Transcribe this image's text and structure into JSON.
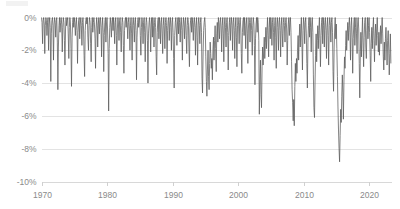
{
  "chart_data": {
    "type": "line",
    "title": "",
    "subtitle": "",
    "xlabel": "",
    "ylabel": "",
    "xlim": [
      1970,
      2023.5
    ],
    "ylim": [
      -10,
      0
    ],
    "grid": true,
    "legend": false,
    "legend_position": "none",
    "series_name": "Drawdown",
    "line_color": "#595959",
    "grid_color": "#e3e3e3",
    "tick_label_color": "#8a8a8a",
    "background_color": "#ffffff",
    "y_ticks": [
      0,
      -2,
      -4,
      -6,
      -8,
      -10
    ],
    "y_tick_labels": [
      "0%",
      "-2%",
      "-4%",
      "-6%",
      "-8%",
      "-10%"
    ],
    "x_ticks": [
      1970,
      1980,
      1990,
      2000,
      2010,
      2020
    ],
    "x_tick_labels": [
      "1970",
      "1980",
      "1990",
      "2000",
      "2010",
      "2020"
    ],
    "x": [
      1970.0,
      1970.08,
      1970.17,
      1970.25,
      1970.33,
      1970.42,
      1970.5,
      1970.58,
      1970.67,
      1970.75,
      1970.83,
      1970.92,
      1971.0,
      1971.08,
      1971.17,
      1971.25,
      1971.33,
      1971.42,
      1971.5,
      1971.58,
      1971.67,
      1971.75,
      1971.83,
      1971.92,
      1972.0,
      1972.08,
      1972.17,
      1972.25,
      1972.33,
      1972.42,
      1972.5,
      1972.58,
      1972.67,
      1972.75,
      1972.83,
      1972.92,
      1973.0,
      1973.08,
      1973.17,
      1973.25,
      1973.33,
      1973.42,
      1973.5,
      1973.58,
      1973.67,
      1973.75,
      1973.83,
      1973.92,
      1974.0,
      1974.08,
      1974.17,
      1974.25,
      1974.33,
      1974.42,
      1974.5,
      1974.58,
      1974.67,
      1974.75,
      1974.83,
      1974.92,
      1975.0,
      1975.08,
      1975.17,
      1975.25,
      1975.33,
      1975.42,
      1975.5,
      1975.58,
      1975.67,
      1975.75,
      1975.83,
      1975.92,
      1976.0,
      1976.08,
      1976.17,
      1976.25,
      1976.33,
      1976.42,
      1976.5,
      1976.58,
      1976.67,
      1976.75,
      1976.83,
      1976.92,
      1977.0,
      1977.08,
      1977.17,
      1977.25,
      1977.33,
      1977.42,
      1977.5,
      1977.58,
      1977.67,
      1977.75,
      1977.83,
      1977.92,
      1978.0,
      1978.08,
      1978.17,
      1978.25,
      1978.33,
      1978.42,
      1978.5,
      1978.58,
      1978.67,
      1978.75,
      1978.83,
      1978.92,
      1979.0,
      1979.08,
      1979.17,
      1979.25,
      1979.33,
      1979.42,
      1979.5,
      1979.58,
      1979.67,
      1979.75,
      1979.83,
      1979.92,
      1980.0,
      1980.08,
      1980.17,
      1980.25,
      1980.33,
      1980.42,
      1980.5,
      1980.58,
      1980.67,
      1980.75,
      1980.83,
      1980.92,
      1981.0,
      1981.08,
      1981.17,
      1981.25,
      1981.33,
      1981.42,
      1981.5,
      1981.58,
      1981.67,
      1981.75,
      1981.83,
      1981.92,
      1982.0,
      1982.08,
      1982.17,
      1982.25,
      1982.33,
      1982.42,
      1982.5,
      1982.58,
      1982.67,
      1982.75,
      1982.83,
      1982.92,
      1983.0,
      1983.08,
      1983.17,
      1983.25,
      1983.33,
      1983.42,
      1983.5,
      1983.58,
      1983.67,
      1983.75,
      1983.83,
      1983.92,
      1984.0,
      1984.08,
      1984.17,
      1984.25,
      1984.33,
      1984.42,
      1984.5,
      1984.58,
      1984.67,
      1984.75,
      1984.83,
      1984.92,
      1985.0,
      1985.08,
      1985.17,
      1985.25,
      1985.33,
      1985.42,
      1985.5,
      1985.58,
      1985.67,
      1985.75,
      1985.83,
      1985.92,
      1986.0,
      1986.08,
      1986.17,
      1986.25,
      1986.33,
      1986.42,
      1986.5,
      1986.58,
      1986.67,
      1986.75,
      1986.83,
      1986.92,
      1987.0,
      1987.08,
      1987.17,
      1987.25,
      1987.33,
      1987.42,
      1987.5,
      1987.58,
      1987.67,
      1987.75,
      1987.83,
      1987.92,
      1988.0,
      1988.08,
      1988.17,
      1988.25,
      1988.33,
      1988.42,
      1988.5,
      1988.58,
      1988.67,
      1988.75,
      1988.83,
      1988.92,
      1989.0,
      1989.08,
      1989.17,
      1989.25,
      1989.33,
      1989.42,
      1989.5,
      1989.58,
      1989.67,
      1989.75,
      1989.83,
      1989.92,
      1990.0,
      1990.08,
      1990.17,
      1990.25,
      1990.33,
      1990.42,
      1990.5,
      1990.58,
      1990.67,
      1990.75,
      1990.83,
      1990.92,
      1991.0,
      1991.08,
      1991.17,
      1991.25,
      1991.33,
      1991.42,
      1991.5,
      1991.58,
      1991.67,
      1991.75,
      1991.83,
      1991.92,
      1992.0,
      1992.08,
      1992.17,
      1992.25,
      1992.33,
      1992.42,
      1992.5,
      1992.58,
      1992.67,
      1992.75,
      1992.83,
      1992.92,
      1993.0,
      1993.08,
      1993.17,
      1993.25,
      1993.33,
      1993.42,
      1993.5,
      1993.58,
      1993.67,
      1993.75,
      1993.83,
      1993.92,
      1994.0,
      1994.08,
      1994.17,
      1994.25,
      1994.33,
      1994.42,
      1994.5,
      1994.58,
      1994.67,
      1994.75,
      1994.83,
      1994.92,
      1995.0,
      1995.08,
      1995.17,
      1995.25,
      1995.33,
      1995.42,
      1995.5,
      1995.58,
      1995.67,
      1995.75,
      1995.83,
      1995.92,
      1996.0,
      1996.08,
      1996.17,
      1996.25,
      1996.33,
      1996.42,
      1996.5,
      1996.58,
      1996.67,
      1996.75,
      1996.83,
      1996.92,
      1997.0,
      1997.08,
      1997.17,
      1997.25,
      1997.33,
      1997.42,
      1997.5,
      1997.58,
      1997.67,
      1997.75,
      1997.83,
      1997.92,
      1998.0,
      1998.08,
      1998.17,
      1998.25,
      1998.33,
      1998.42,
      1998.5,
      1998.58,
      1998.67,
      1998.75,
      1998.83,
      1998.92,
      1999.0,
      1999.08,
      1999.17,
      1999.25,
      1999.33,
      1999.42,
      1999.5,
      1999.58,
      1999.67,
      1999.75,
      1999.83,
      1999.92,
      2000.0,
      2000.08,
      2000.17,
      2000.25,
      2000.33,
      2000.42,
      2000.5,
      2000.58,
      2000.67,
      2000.75,
      2000.83,
      2000.92,
      2001.0,
      2001.08,
      2001.17,
      2001.25,
      2001.33,
      2001.42,
      2001.5,
      2001.58,
      2001.67,
      2001.75,
      2001.83,
      2001.92,
      2002.0,
      2002.08,
      2002.17,
      2002.25,
      2002.33,
      2002.42,
      2002.5,
      2002.58,
      2002.67,
      2002.75,
      2002.83,
      2002.92,
      2003.0,
      2003.08,
      2003.17,
      2003.25,
      2003.33,
      2003.42,
      2003.5,
      2003.58,
      2003.67,
      2003.75,
      2003.83,
      2003.92,
      2004.0,
      2004.08,
      2004.17,
      2004.25,
      2004.33,
      2004.42,
      2004.5,
      2004.58,
      2004.67,
      2004.75,
      2004.83,
      2004.92,
      2005.0,
      2005.08,
      2005.17,
      2005.25,
      2005.33,
      2005.42,
      2005.5,
      2005.58,
      2005.67,
      2005.75,
      2005.83,
      2005.92,
      2006.0,
      2006.08,
      2006.17,
      2006.25,
      2006.33,
      2006.42,
      2006.5,
      2006.58,
      2006.67,
      2006.75,
      2006.83,
      2006.92,
      2007.0,
      2007.08,
      2007.17,
      2007.25,
      2007.33,
      2007.42,
      2007.5,
      2007.58,
      2007.67,
      2007.75,
      2007.83,
      2007.92,
      2008.0,
      2008.08,
      2008.17,
      2008.25,
      2008.33,
      2008.42,
      2008.5,
      2008.58,
      2008.67,
      2008.75,
      2008.83,
      2008.92,
      2009.0,
      2009.08,
      2009.17,
      2009.25,
      2009.33,
      2009.42,
      2009.5,
      2009.58,
      2009.67,
      2009.75,
      2009.83,
      2009.92,
      2010.0,
      2010.08,
      2010.17,
      2010.25,
      2010.33,
      2010.42,
      2010.5,
      2010.58,
      2010.67,
      2010.75,
      2010.83,
      2010.92,
      2011.0,
      2011.08,
      2011.17,
      2011.25,
      2011.33,
      2011.42,
      2011.5,
      2011.58,
      2011.67,
      2011.75,
      2011.83,
      2011.92,
      2012.0,
      2012.08,
      2012.17,
      2012.25,
      2012.33,
      2012.42,
      2012.5,
      2012.58,
      2012.67,
      2012.75,
      2012.83,
      2012.92,
      2013.0,
      2013.08,
      2013.17,
      2013.25,
      2013.33,
      2013.42,
      2013.5,
      2013.58,
      2013.67,
      2013.75,
      2013.83,
      2013.92,
      2014.0,
      2014.08,
      2014.17,
      2014.25,
      2014.33,
      2014.42,
      2014.5,
      2014.58,
      2014.67,
      2014.75,
      2014.83,
      2014.92,
      2015.0,
      2015.08,
      2015.17,
      2015.25,
      2015.33,
      2015.42,
      2015.5,
      2015.58,
      2015.67,
      2015.75,
      2015.83,
      2015.92,
      2016.0,
      2016.08,
      2016.17,
      2016.25,
      2016.33,
      2016.42,
      2016.5,
      2016.58,
      2016.67,
      2016.75,
      2016.83,
      2016.92,
      2017.0,
      2017.08,
      2017.17,
      2017.25,
      2017.33,
      2017.42,
      2017.5,
      2017.58,
      2017.67,
      2017.75,
      2017.83,
      2017.92,
      2018.0,
      2018.08,
      2018.17,
      2018.25,
      2018.33,
      2018.42,
      2018.5,
      2018.58,
      2018.67,
      2018.75,
      2018.83,
      2018.92,
      2019.0,
      2019.08,
      2019.17,
      2019.25,
      2019.33,
      2019.42,
      2019.5,
      2019.58,
      2019.67,
      2019.75,
      2019.83,
      2019.92,
      2020.0,
      2020.08,
      2020.17,
      2020.25,
      2020.33,
      2020.42,
      2020.5,
      2020.58,
      2020.67,
      2020.75,
      2020.83,
      2020.92,
      2021.0,
      2021.08,
      2021.17,
      2021.25,
      2021.33,
      2021.42,
      2021.5,
      2021.58,
      2021.67,
      2021.75,
      2021.83,
      2021.92,
      2022.0,
      2022.08,
      2022.17,
      2022.25,
      2022.33,
      2022.42,
      2022.5,
      2022.58,
      2022.67,
      2022.75,
      2022.83,
      2022.92,
      2023.0,
      2023.08,
      2023.17,
      2023.25,
      2023.33
    ],
    "values": [
      0.0,
      -0.3,
      -1.6,
      -0.2,
      0.0,
      -0.4,
      -2.2,
      -0.5,
      0.0,
      -0.2,
      -1.1,
      -0.3,
      0.0,
      -2.0,
      -0.4,
      0.0,
      -0.6,
      -3.9,
      -1.0,
      -0.2,
      0.0,
      -0.5,
      -2.6,
      -0.4,
      0.0,
      -0.3,
      -1.2,
      -0.2,
      0.0,
      -1.5,
      -4.4,
      -1.8,
      -0.5,
      0.0,
      -0.9,
      -0.3,
      0.0,
      -0.4,
      -2.1,
      -0.6,
      0.0,
      -0.3,
      -1.4,
      -2.9,
      -0.7,
      0.0,
      -0.5,
      -0.2,
      0.0,
      -1.0,
      -2.5,
      -0.6,
      0.0,
      -0.4,
      -1.9,
      -4.2,
      -1.2,
      -0.3,
      0.0,
      -0.6,
      0.0,
      -0.3,
      -1.1,
      -0.4,
      0.0,
      -0.8,
      -2.8,
      -0.9,
      -0.2,
      0.0,
      -1.3,
      -0.4,
      0.0,
      -0.5,
      -1.7,
      -0.3,
      0.0,
      -0.7,
      -2.3,
      -3.6,
      -0.8,
      -0.2,
      0.0,
      -0.4,
      0.0,
      -1.2,
      -2.0,
      -0.5,
      0.0,
      -0.3,
      -1.6,
      -2.7,
      -0.6,
      0.0,
      -0.9,
      -0.3,
      0.0,
      -0.4,
      -1.3,
      -3.1,
      -0.7,
      0.0,
      -0.5,
      -1.8,
      -0.4,
      0.0,
      -1.0,
      -0.2,
      0.0,
      -0.6,
      -2.4,
      -0.5,
      0.0,
      -0.9,
      -3.3,
      -1.1,
      -0.3,
      0.0,
      -1.5,
      -0.4,
      0.0,
      -0.7,
      -2.2,
      -5.7,
      -1.9,
      -0.6,
      0.0,
      -0.4,
      -1.2,
      -0.3,
      0.0,
      -0.8,
      0.0,
      -0.5,
      -1.6,
      -0.3,
      0.0,
      -1.1,
      -2.9,
      -0.7,
      0.0,
      -0.4,
      -1.4,
      -0.2,
      0.0,
      -0.9,
      -2.1,
      -0.5,
      0.0,
      -0.3,
      -1.7,
      -3.4,
      -0.8,
      -0.2,
      0.0,
      -0.6,
      0.0,
      -0.4,
      -1.3,
      -0.3,
      0.0,
      -0.7,
      -2.0,
      -0.5,
      0.0,
      -1.0,
      -2.6,
      -0.4,
      0.0,
      -0.5,
      -1.5,
      -0.3,
      0.0,
      -0.8,
      -3.8,
      -1.2,
      -0.3,
      0.0,
      -0.6,
      -0.2,
      0.0,
      -1.1,
      -2.3,
      -0.6,
      0.0,
      -0.4,
      -1.6,
      -0.3,
      0.0,
      -0.9,
      -2.7,
      -0.5,
      0.0,
      -0.3,
      -1.4,
      -4.0,
      -1.0,
      -0.3,
      0.0,
      -0.7,
      -2.1,
      -0.4,
      0.0,
      -1.2,
      0.0,
      -0.5,
      -1.8,
      -0.3,
      0.0,
      -0.6,
      -2.4,
      -3.5,
      -0.9,
      -0.2,
      0.0,
      -1.3,
      0.0,
      -0.4,
      -1.6,
      -0.3,
      0.0,
      -1.0,
      -2.2,
      -0.5,
      0.0,
      -0.7,
      -1.9,
      -0.3,
      0.0,
      -0.5,
      -2.8,
      -0.8,
      -0.2,
      0.0,
      -1.4,
      -0.4,
      0.0,
      -0.6,
      -2.0,
      -0.3,
      0.0,
      -0.9,
      -2.5,
      -4.3,
      -1.1,
      -0.3,
      0.0,
      -0.7,
      -1.7,
      -0.4,
      0.0,
      -1.0,
      0.0,
      -0.3,
      -1.5,
      -0.4,
      0.0,
      -0.8,
      -2.6,
      -0.6,
      0.0,
      -0.4,
      -1.3,
      -0.2,
      0.0,
      -1.1,
      -2.2,
      -0.5,
      0.0,
      -0.3,
      -1.8,
      -3.0,
      -0.7,
      -0.2,
      0.0,
      -0.9,
      0.0,
      -0.4,
      -1.4,
      -0.3,
      0.0,
      -0.6,
      -2.3,
      -0.5,
      0.0,
      -1.2,
      -2.9,
      -0.4,
      0.0,
      -0.5,
      -1.6,
      -0.3,
      0.0,
      -0.9,
      -3.7,
      -4.6,
      -2.1,
      -0.8,
      -0.3,
      0.0,
      -0.6,
      -2.4,
      -3.9,
      -4.8,
      -3.2,
      -2.0,
      -3.6,
      -4.4,
      -2.8,
      -1.5,
      -2.2,
      -3.1,
      -2.5,
      -3.8,
      -2.0,
      -1.2,
      -2.6,
      -1.4,
      -0.5,
      -1.9,
      -3.3,
      -1.0,
      -0.3,
      -1.5,
      0.0,
      -0.4,
      -1.3,
      -0.3,
      0.0,
      -0.7,
      -2.1,
      -0.5,
      0.0,
      -1.0,
      -2.7,
      -0.4,
      0.0,
      -0.6,
      -1.8,
      -0.3,
      0.0,
      -0.9,
      -3.2,
      -1.1,
      -0.3,
      0.0,
      -1.4,
      -0.4,
      0.0,
      -0.5,
      -2.0,
      -0.3,
      0.0,
      -0.8,
      -2.5,
      -0.6,
      0.0,
      -1.2,
      -3.0,
      -0.5,
      0.0,
      -0.4,
      -1.6,
      -0.3,
      0.0,
      -0.7,
      -2.2,
      -3.4,
      -0.9,
      -0.2,
      0.0,
      -1.1,
      0.0,
      -0.5,
      -1.9,
      -0.4,
      0.0,
      -1.0,
      -2.8,
      -0.7,
      0.0,
      -0.3,
      -1.5,
      -0.3,
      0.0,
      -0.8,
      -2.3,
      -0.5,
      0.0,
      -0.4,
      -1.7,
      -4.1,
      -1.3,
      -0.4,
      0.0,
      -0.9,
      0.0,
      -0.3,
      -1.4,
      -5.9,
      -3.8,
      -2.6,
      -4.7,
      -5.5,
      -3.0,
      -1.8,
      -2.9,
      -2.0,
      -1.2,
      -2.5,
      -1.5,
      -0.6,
      -1.9,
      -0.8,
      0.0,
      -1.1,
      -2.4,
      -0.6,
      0.0,
      -1.3,
      0.0,
      -0.4,
      -1.7,
      -0.3,
      0.0,
      -0.9,
      -2.6,
      -0.5,
      0.0,
      -1.2,
      -3.1,
      -0.4,
      0.0,
      -0.6,
      -2.0,
      -0.3,
      0.0,
      -0.8,
      -2.4,
      -0.5,
      0.0,
      -1.0,
      -1.8,
      -0.3,
      0.0,
      -0.5,
      -1.5,
      -0.3,
      0.0,
      -0.7,
      -2.9,
      -1.4,
      -0.4,
      0.0,
      -1.1,
      -0.3,
      0.0,
      -0.9,
      -2.7,
      -4.4,
      -5.2,
      -6.3,
      -5.0,
      -6.6,
      -4.2,
      -2.8,
      -3.9,
      -2.5,
      -3.4,
      -2.0,
      -1.1,
      -2.6,
      -1.3,
      -0.4,
      -1.8,
      -0.7,
      0.0,
      -1.5,
      -3.2,
      -0.8,
      0.0,
      -0.4,
      -1.6,
      -0.3,
      0.0,
      -1.0,
      -2.8,
      -4.3,
      -1.5,
      -0.5,
      0.0,
      -1.2,
      0.0,
      -0.6,
      -2.1,
      -0.4,
      0.0,
      -0.9,
      -3.5,
      -5.5,
      -6.1,
      -4.0,
      -2.3,
      -1.0,
      -2.7,
      -1.4,
      -0.5,
      -1.9,
      -0.8,
      0.0,
      -1.3,
      -3.0,
      -1.1,
      -0.3,
      0.0,
      -1.6,
      0.0,
      -0.5,
      -1.8,
      -0.3,
      0.0,
      -0.8,
      -2.5,
      -0.6,
      0.0,
      -1.1,
      -2.9,
      -0.5,
      0.0,
      -0.4,
      -1.5,
      -0.3,
      0.0,
      -0.9,
      -3.3,
      -4.5,
      -1.8,
      -0.7,
      0.0,
      -1.3,
      -0.4,
      -1.9,
      -3.6,
      -5.4,
      -6.8,
      -8.0,
      -8.8,
      -7.2,
      -5.6,
      -6.4,
      -4.8,
      -3.5,
      -4.6,
      -6.2,
      -3.8,
      -2.4,
      -3.1,
      -1.7,
      -0.8,
      -2.0,
      -1.0,
      -0.3,
      -1.4,
      -0.5,
      0.0,
      -0.9,
      -2.6,
      -0.5,
      0.0,
      -1.2,
      -3.4,
      -1.3,
      -0.4,
      0.0,
      -1.7,
      -0.6,
      0.0,
      -1.0,
      -2.2,
      -0.4,
      0.0,
      -0.7,
      -2.8,
      -4.9,
      -2.1,
      -0.9,
      -2.4,
      -1.1,
      0.0,
      -1.5,
      -3.0,
      -1.2,
      -0.3,
      0.0,
      -1.8,
      -2.5,
      -0.8,
      0.0,
      -1.3,
      -0.5,
      0.0,
      -0.9,
      -2.3,
      -3.9,
      -1.6,
      -0.6,
      -1.9,
      -0.8,
      0.0,
      -1.4,
      -2.7,
      -1.0,
      -0.4,
      -1.7,
      -0.7,
      0.0,
      -1.1,
      -2.1,
      -0.9,
      -2.3,
      -1.2,
      -0.5,
      -1.6,
      -0.7,
      0.0,
      -1.0,
      -2.4,
      -3.2,
      -1.5,
      -2.6,
      -1.3,
      -0.6,
      -1.8,
      -2.9,
      -1.4,
      -0.8,
      -2.0,
      -3.5,
      -2.2,
      -1.0,
      -2.8
    ]
  }
}
